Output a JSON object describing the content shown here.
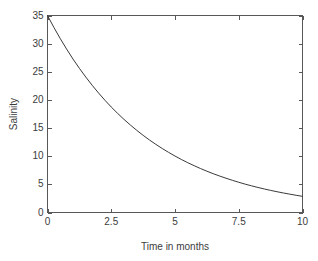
{
  "figure": {
    "background_color": "#ffffff",
    "axes_color": "#585858",
    "curve_color": "#3a3a3a",
    "text_color": "#3c3c3c"
  },
  "axes": {
    "ylabel": "Salinity",
    "xlabel": "Time in months",
    "ytick_labels": [
      "0",
      "5",
      "10",
      "15",
      "20",
      "25",
      "30",
      "35"
    ],
    "xtick_labels": [
      "0",
      "2.5",
      "5",
      "7.5",
      "10"
    ]
  },
  "chart_data": {
    "type": "line",
    "title": "",
    "subtitle": "",
    "xlabel": "Time in months",
    "ylabel": "Salinity",
    "xlim": [
      0,
      10
    ],
    "ylim": [
      0,
      35
    ],
    "xticks": [
      0,
      2.5,
      5,
      7.5,
      10
    ],
    "yticks": [
      0,
      5,
      10,
      15,
      20,
      25,
      30,
      35
    ],
    "grid": false,
    "legend": false,
    "annotations": [],
    "series": [
      {
        "name": "Salinity",
        "color": "#3a3a3a",
        "x": [
          0,
          0.25,
          0.5,
          0.75,
          1,
          1.25,
          1.5,
          1.75,
          2,
          2.25,
          2.5,
          2.75,
          3,
          3.25,
          3.5,
          3.75,
          4,
          4.25,
          4.5,
          4.75,
          5,
          5.25,
          5.5,
          5.75,
          6,
          6.25,
          6.5,
          6.75,
          7,
          7.25,
          7.5,
          7.75,
          8,
          8.25,
          8.5,
          8.75,
          9,
          9.25,
          9.5,
          9.75,
          10
        ],
        "y": [
          35,
          32.88,
          30.9,
          29.03,
          27.26,
          25.62,
          24.07,
          22.61,
          21.24,
          19.95,
          18.74,
          17.61,
          16.54,
          15.54,
          14.6,
          13.71,
          12.88,
          12.1,
          11.37,
          10.68,
          10.03,
          9.42,
          8.85,
          8.32,
          7.81,
          7.34,
          6.89,
          6.48,
          6.09,
          5.72,
          5.37,
          5.04,
          4.74,
          4.45,
          4.18,
          3.93,
          3.69,
          3.47,
          3.26,
          3.06,
          2.87
        ]
      }
    ]
  }
}
